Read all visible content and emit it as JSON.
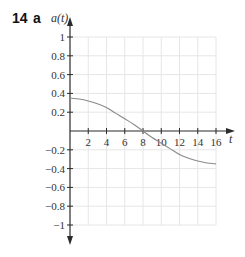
{
  "question": {
    "number": "14",
    "part": "a"
  },
  "chart_data": {
    "type": "line",
    "title": "",
    "xlabel": "t",
    "ylabel": "a(t)",
    "xlim": [
      0,
      16
    ],
    "ylim": [
      -1,
      1
    ],
    "x_ticks": [
      2,
      4,
      6,
      8,
      10,
      12,
      14,
      16
    ],
    "y_ticks": [
      1,
      0.8,
      0.6,
      0.4,
      0.2,
      -0.2,
      -0.4,
      -0.6,
      -0.8,
      -1
    ],
    "y_tick_labels": [
      "1",
      "0.8",
      "0.6",
      "0.4",
      "0.2",
      "−0.2",
      "−0.4",
      "−0.6",
      "−0.8",
      "−1"
    ],
    "grid": true,
    "grid_x_step": 2,
    "grid_y_step": 0.2,
    "legend": null,
    "series": [
      {
        "name": "a(t)",
        "x": [
          0,
          1,
          2,
          3,
          4,
          5,
          6,
          7,
          8,
          9,
          10,
          11,
          12,
          13,
          14,
          15,
          16
        ],
        "values": [
          0.35,
          0.34,
          0.32,
          0.29,
          0.25,
          0.19,
          0.13,
          0.07,
          0,
          -0.07,
          -0.13,
          -0.19,
          -0.25,
          -0.29,
          -0.32,
          -0.34,
          -0.35
        ]
      }
    ]
  },
  "colors": {
    "axis": "#2b2b2b",
    "grid": "#e6e6e6",
    "curve": "#8a8a8a",
    "text": "#333333"
  }
}
